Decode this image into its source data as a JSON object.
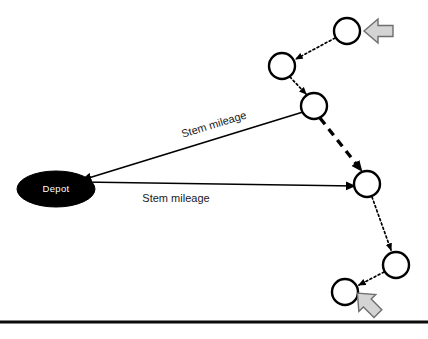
{
  "diagram": {
    "background_color": "#ffffff",
    "depot": {
      "label": "Depot",
      "fill_color": "#000000",
      "text_color": "#ffffff",
      "cx": 56,
      "cy": 189,
      "rx": 39,
      "ry": 18
    },
    "labels": [
      {
        "id": "stem-mileage-upper",
        "text": "Stem mileage",
        "x": 215,
        "y": 128,
        "rotation": -17
      },
      {
        "id": "stem-mileage-lower",
        "text": "Stem mileage",
        "x": 176,
        "y": 202,
        "rotation": 0
      }
    ],
    "nodes": [
      {
        "id": "node-1",
        "cx": 347,
        "cy": 31,
        "r": 13
      },
      {
        "id": "node-2",
        "cx": 282,
        "cy": 66,
        "r": 13
      },
      {
        "id": "node-3",
        "cx": 314,
        "cy": 106,
        "r": 13
      },
      {
        "id": "node-4",
        "cx": 367,
        "cy": 184,
        "r": 13
      },
      {
        "id": "node-5",
        "cx": 396,
        "cy": 265,
        "r": 13
      },
      {
        "id": "node-6",
        "cx": 345,
        "cy": 292,
        "r": 13
      }
    ],
    "links": [
      {
        "id": "link-node1-node2",
        "style": "dotted",
        "from": "node-1",
        "to": "node-2"
      },
      {
        "id": "link-node2-node3",
        "style": "dotted",
        "from": "node-2",
        "to": "node-3"
      },
      {
        "id": "link-node3-node4",
        "style": "dashed",
        "from": "node-3",
        "to": "node-4"
      },
      {
        "id": "link-node4-node5",
        "style": "dotted",
        "from": "node-4",
        "to": "node-5"
      },
      {
        "id": "link-node5-node6",
        "style": "dotted",
        "from": "node-5",
        "to": "node-6"
      },
      {
        "id": "link-node3-depot",
        "style": "solid",
        "from": "node-3",
        "to": "depot"
      },
      {
        "id": "link-depot-node4",
        "style": "solid",
        "from": "depot",
        "to": "node-4"
      }
    ],
    "block_arrows": [
      {
        "id": "inbound-block-arrow",
        "direction": "left",
        "color": "#d4d4d4",
        "outline": "#6e6e6e"
      },
      {
        "id": "outbound-block-arrow",
        "direction": "down-right",
        "color": "#d4d4d4",
        "outline": "#6e6e6e"
      }
    ],
    "bottom_rule": {
      "id": "bottom-divider",
      "y": 322,
      "color": "#0b0b0b"
    }
  }
}
